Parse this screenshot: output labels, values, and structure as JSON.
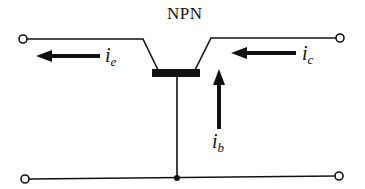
{
  "diagram": {
    "title": "NPN",
    "currents": {
      "emitter": {
        "symbol": "i",
        "subscript": "e"
      },
      "collector": {
        "symbol": "i",
        "subscript": "c"
      },
      "base": {
        "symbol": "i",
        "subscript": "b"
      }
    },
    "colors": {
      "stroke": "#111111",
      "background": "#ffffff"
    }
  }
}
